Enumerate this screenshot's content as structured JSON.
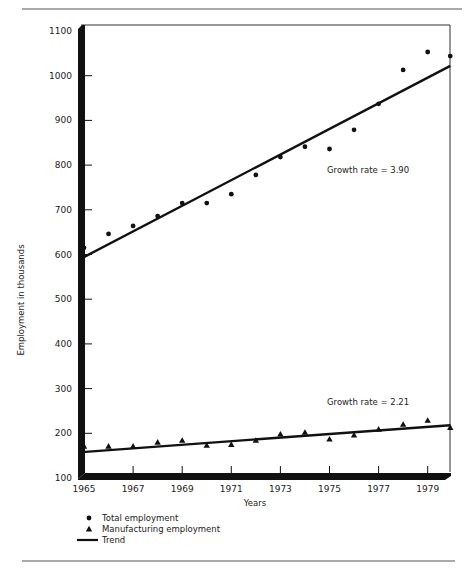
{
  "chart_data": {
    "type": "scatter",
    "title": "",
    "xlabel": "Years",
    "ylabel": "Employment in thousands",
    "xlim": [
      1965,
      1980
    ],
    "ylim": [
      100,
      1100
    ],
    "xticks": [
      1965,
      1967,
      1969,
      1971,
      1973,
      1975,
      1977,
      1979
    ],
    "yticks": [
      100,
      200,
      300,
      400,
      500,
      600,
      700,
      800,
      900,
      1000,
      1100
    ],
    "grid": false,
    "legend_position": "bottom-left",
    "x": [
      1965,
      1966,
      1967,
      1968,
      1969,
      1970,
      1971,
      1972,
      1973,
      1974,
      1975,
      1976,
      1977,
      1978,
      1979,
      1980
    ],
    "series": [
      {
        "name": "Total employment",
        "marker": "circle",
        "values": [
          615,
          646,
          664,
          686,
          715,
          715,
          735,
          778,
          818,
          841,
          836,
          879,
          937,
          1013,
          1053,
          1044
        ]
      },
      {
        "name": "Manufacturing employment",
        "marker": "triangle",
        "values": [
          171,
          171,
          171,
          180,
          184,
          173,
          175,
          184,
          198,
          202,
          187,
          196,
          209,
          220,
          229,
          213
        ]
      }
    ],
    "trends": [
      {
        "name": "Trend",
        "series": "Total employment",
        "start": [
          1965,
          592
        ],
        "end": [
          1980,
          1022
        ]
      },
      {
        "name": "Trend",
        "series": "Manufacturing employment",
        "start": [
          1965,
          158
        ],
        "end": [
          1980,
          218
        ]
      }
    ],
    "annotations": [
      {
        "text": "Growth rate = 3.90",
        "x": 1975.0,
        "y": 785
      },
      {
        "text": "Growth rate = 2.21",
        "x": 1975.0,
        "y": 260
      }
    ],
    "legend": [
      {
        "label": "Total employment",
        "marker": "circle"
      },
      {
        "label": "Manufacturing employment",
        "marker": "triangle"
      },
      {
        "label": "Trend",
        "marker": "line"
      }
    ]
  },
  "colors": {
    "ink": "#111111",
    "rule": "#555555",
    "background": "#ffffff"
  }
}
